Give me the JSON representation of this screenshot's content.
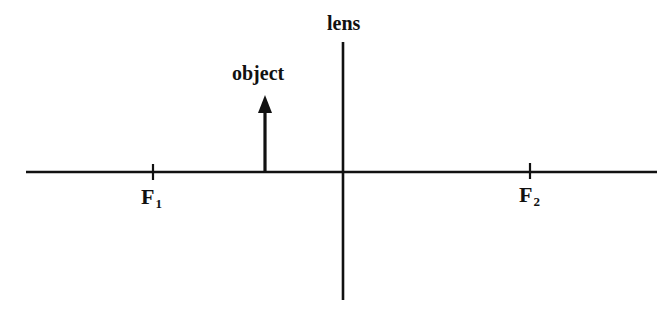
{
  "diagram": {
    "type": "thin lens ray diagram",
    "labels": {
      "lens": "lens",
      "object": "object",
      "focal_point_1": {
        "base": "F",
        "subscript": "1"
      },
      "focal_point_2": {
        "base": "F",
        "subscript": "2"
      }
    },
    "elements": {
      "optical_axis": {
        "y": 172,
        "x_start": 26,
        "x_end": 657
      },
      "lens_line": {
        "x": 343,
        "y_top": 42,
        "y_bottom": 300
      },
      "object_arrow": {
        "x": 265,
        "base_y": 172,
        "tip_y": 95,
        "direction": "up"
      },
      "focal_points": [
        {
          "name": "F1",
          "x": 153,
          "side": "left"
        },
        {
          "name": "F2",
          "x": 530,
          "side": "right"
        }
      ]
    },
    "colors": {
      "line": "#111111",
      "background": "#ffffff"
    }
  }
}
